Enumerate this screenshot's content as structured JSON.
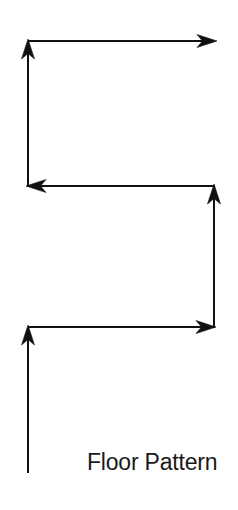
{
  "figure": {
    "title": "Floor Pattern",
    "background_color": "#ffffff",
    "stroke_color": "#111111",
    "stroke_width": 2,
    "canvas": {
      "width": 238,
      "height": 510
    },
    "diagram_type": "boustrophedon-coverage-path",
    "arrowhead_count": 5,
    "path_points": [
      {
        "x": 28,
        "y": 473,
        "label": "start"
      },
      {
        "x": 28,
        "y": 327,
        "label": "corner-1"
      },
      {
        "x": 214,
        "y": 327,
        "label": "corner-2"
      },
      {
        "x": 214,
        "y": 186,
        "label": "corner-3"
      },
      {
        "x": 28,
        "y": 186,
        "label": "corner-4"
      },
      {
        "x": 28,
        "y": 41,
        "label": "corner-5"
      },
      {
        "x": 215,
        "y": 41,
        "label": "end"
      }
    ],
    "segments": [
      {
        "name": "segment-1-up",
        "direction": "up",
        "x1": 28,
        "y1": 473,
        "x2": 28,
        "y2": 327,
        "arrowhead": "up"
      },
      {
        "name": "segment-2-right",
        "direction": "right",
        "x1": 28,
        "y1": 327,
        "x2": 214,
        "y2": 327,
        "arrowhead": "right"
      },
      {
        "name": "segment-3-up",
        "direction": "up",
        "x1": 214,
        "y1": 327,
        "x2": 214,
        "y2": 186,
        "arrowhead": "up"
      },
      {
        "name": "segment-4-left",
        "direction": "left",
        "x1": 214,
        "y1": 186,
        "x2": 28,
        "y2": 186,
        "arrowhead": "left"
      },
      {
        "name": "segment-5-up",
        "direction": "up",
        "x1": 28,
        "y1": 186,
        "x2": 28,
        "y2": 41,
        "arrowhead": "up"
      },
      {
        "name": "segment-6-right",
        "direction": "right",
        "x1": 28,
        "y1": 41,
        "x2": 215,
        "y2": 41,
        "arrowhead": "right"
      }
    ]
  }
}
